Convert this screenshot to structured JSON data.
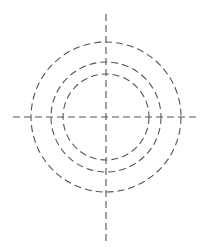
{
  "diagram": {
    "type": "concentric-circles-with-crosshair",
    "background": "#ffffff",
    "stroke_color": "#555555",
    "stroke_width": 1.1,
    "dash_pattern": "7 4",
    "center": {
      "x": 106,
      "y": 117
    },
    "circles": [
      {
        "name": "outer",
        "r": 75
      },
      {
        "name": "middle",
        "r": 55
      },
      {
        "name": "inner",
        "r": 43
      }
    ],
    "axes": {
      "vertical": {
        "x": 106,
        "y1": 14,
        "y2": 241
      },
      "horizontal": {
        "y": 117,
        "x1": 13,
        "x2": 200
      }
    }
  }
}
